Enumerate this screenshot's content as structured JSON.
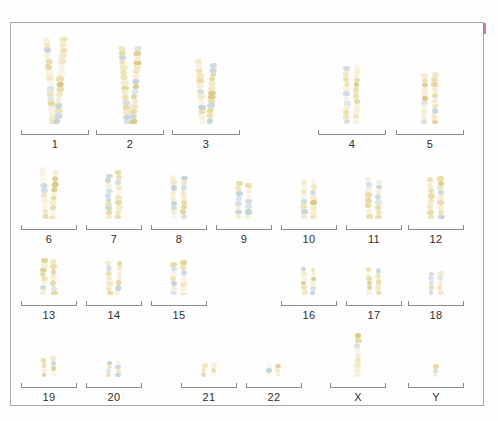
{
  "figure": {
    "type": "karyotype",
    "title": "",
    "sex_karyotype": "male (single X, single Y)",
    "border_color": "#a8a8a8",
    "background": "#fefefe",
    "corner_mark_color": "#d4647f",
    "label_color": "#2e2e2e",
    "bracket_color": "#8d8d8d",
    "band_colors": {
      "light": "#f2e6bd",
      "medium": "#e8d89a",
      "dark": "#d9c67e",
      "blue": "#c3d3da",
      "pale": "#f6efd9"
    }
  },
  "rows": [
    {
      "name": "row-A",
      "groups": [
        {
          "label": "1",
          "count": 2,
          "height": 86,
          "shape": "curved",
          "left": 21,
          "width": 68
        },
        {
          "label": "2",
          "count": 2,
          "height": 78,
          "shape": "curved",
          "left": 96,
          "width": 68
        },
        {
          "label": "3",
          "count": 2,
          "height": 66,
          "shape": "curved",
          "left": 172,
          "width": 68
        },
        {
          "label": "4",
          "count": 2,
          "height": 58,
          "shape": "straight",
          "left": 318,
          "width": 68
        },
        {
          "label": "5",
          "count": 2,
          "height": 54,
          "shape": "straight",
          "left": 396,
          "width": 68
        }
      ]
    },
    {
      "name": "row-B",
      "groups": [
        {
          "label": "6",
          "count": 2,
          "height": 52,
          "shape": "curved",
          "left": 21,
          "width": 56
        },
        {
          "label": "7",
          "count": 2,
          "height": 48,
          "shape": "straight",
          "left": 86,
          "width": 56
        },
        {
          "label": "8",
          "count": 2,
          "height": 44,
          "shape": "straight",
          "left": 151,
          "width": 56
        },
        {
          "label": "9",
          "count": 2,
          "height": 38,
          "shape": "straight",
          "left": 216,
          "width": 56
        },
        {
          "label": "10",
          "count": 2,
          "height": 40,
          "shape": "straight",
          "left": 281,
          "width": 56
        },
        {
          "label": "11",
          "count": 2,
          "height": 42,
          "shape": "straight",
          "left": 346,
          "width": 56
        },
        {
          "label": "12",
          "count": 2,
          "height": 42,
          "shape": "straight",
          "left": 408,
          "width": 56
        }
      ]
    },
    {
      "name": "row-C",
      "groups": [
        {
          "label": "13",
          "count": 2,
          "height": 38,
          "shape": "straight",
          "left": 21,
          "width": 56
        },
        {
          "label": "14",
          "count": 2,
          "height": 36,
          "shape": "curved",
          "left": 86,
          "width": 56
        },
        {
          "label": "15",
          "count": 2,
          "height": 34,
          "shape": "straight",
          "left": 151,
          "width": 56
        },
        {
          "label": "16",
          "count": 2,
          "height": 28,
          "shape": "straight",
          "left": 281,
          "width": 56
        },
        {
          "label": "17",
          "count": 2,
          "height": 28,
          "shape": "straight",
          "left": 346,
          "width": 56
        },
        {
          "label": "18",
          "count": 2,
          "height": 25,
          "shape": "straight",
          "left": 408,
          "width": 56
        }
      ]
    },
    {
      "name": "row-D",
      "groups": [
        {
          "label": "19",
          "count": 2,
          "height": 20,
          "shape": "straight",
          "left": 21,
          "width": 56
        },
        {
          "label": "20",
          "count": 2,
          "height": 19,
          "shape": "straight",
          "left": 86,
          "width": 56
        },
        {
          "label": "21",
          "count": 2,
          "height": 15,
          "shape": "straight",
          "left": 181,
          "width": 56
        },
        {
          "label": "22",
          "count": 2,
          "height": 14,
          "shape": "straight",
          "left": 246,
          "width": 56
        },
        {
          "label": "X",
          "count": 1,
          "height": 44,
          "shape": "straight",
          "left": 330,
          "width": 56
        },
        {
          "label": "Y",
          "count": 1,
          "height": 13,
          "shape": "straight",
          "left": 408,
          "width": 56
        }
      ]
    }
  ]
}
